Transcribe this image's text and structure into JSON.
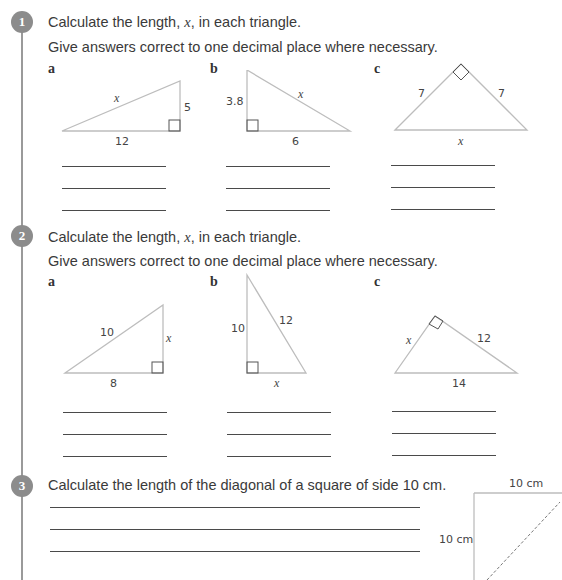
{
  "questions": [
    {
      "number": "1",
      "line1_pre": "Calculate the length, ",
      "line1_var": "x",
      "line1_post": ", in each triangle.",
      "line2": "Give answers correct to one decimal place where necessary.",
      "parts": [
        {
          "label": "a",
          "hyp": "x",
          "vertical": "5",
          "base": "12"
        },
        {
          "label": "b",
          "vertical": "3.8",
          "hyp": "x",
          "base": "6"
        },
        {
          "label": "c",
          "left": "7",
          "right": "7",
          "base": "x"
        }
      ]
    },
    {
      "number": "2",
      "line1_pre": "Calculate the length, ",
      "line1_var": "x",
      "line1_post": ", in each triangle.",
      "line2": "Give answers correct to one decimal place where necessary.",
      "parts": [
        {
          "label": "a",
          "hyp": "10",
          "vertical": "x",
          "base": "8"
        },
        {
          "label": "b",
          "vertical": "10",
          "hyp": "12",
          "base": "x"
        },
        {
          "label": "c",
          "left": "x",
          "right": "12",
          "base": "14"
        }
      ]
    },
    {
      "number": "3",
      "text": "Calculate the length of the diagonal of a square of side 10 cm.",
      "figure": {
        "top": "10 cm",
        "left": "10 cm"
      }
    }
  ]
}
